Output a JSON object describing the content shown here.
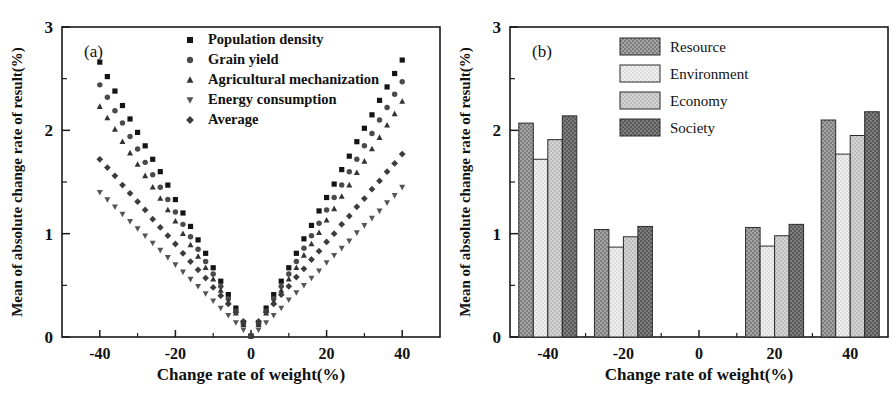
{
  "figure": {
    "width": 896,
    "height": 394,
    "background": "#ffffff",
    "axis_color": "#1a1a1a"
  },
  "panel_a": {
    "label": "(a)",
    "xlabel": "Change rate of weight(%)",
    "ylabel": "Mean of absolute change rate of result(%)",
    "legend": [
      {
        "label": "Population density",
        "marker": "square",
        "color": "#141414"
      },
      {
        "label": "Grain yield",
        "marker": "circle",
        "color": "#4a4a4a"
      },
      {
        "label": "Agricultural mechanization",
        "marker": "triangle-up",
        "color": "#333333"
      },
      {
        "label": "Energy consumption",
        "marker": "triangle-down",
        "color": "#555555"
      },
      {
        "label": "Average",
        "marker": "diamond",
        "color": "#3c3c3c"
      }
    ],
    "chart_data": {
      "type": "scatter",
      "title": "(a)",
      "xlabel": "Change rate of weight(%)",
      "ylabel": "Mean of absolute change rate of result(%)",
      "xlim": [
        -50,
        50
      ],
      "ylim": [
        0,
        3
      ],
      "xticks": [
        -40,
        -20,
        0,
        20,
        40
      ],
      "yticks": [
        0,
        1,
        2,
        3
      ],
      "xminor": [
        -30,
        -10,
        10,
        30
      ],
      "yminor": [
        0.5,
        1.5,
        2.5
      ],
      "grid": false,
      "legend_position": "top-center",
      "x": [
        -40,
        -38,
        -36,
        -34,
        -32,
        -30,
        -28,
        -26,
        -24,
        -22,
        -20,
        -18,
        -16,
        -14,
        -12,
        -10,
        -8,
        -6,
        -4,
        -2,
        0,
        2,
        4,
        6,
        8,
        10,
        12,
        14,
        16,
        18,
        20,
        22,
        24,
        26,
        28,
        30,
        32,
        34,
        36,
        38,
        40
      ],
      "series": [
        {
          "name": "Population density",
          "marker": "square",
          "color": "#141414",
          "values": [
            2.66,
            2.52,
            2.38,
            2.24,
            2.11,
            1.98,
            1.85,
            1.72,
            1.6,
            1.47,
            1.33,
            1.2,
            1.07,
            0.94,
            0.81,
            0.67,
            0.54,
            0.41,
            0.28,
            0.14,
            0.01,
            0.14,
            0.28,
            0.41,
            0.54,
            0.67,
            0.81,
            0.95,
            1.08,
            1.22,
            1.35,
            1.48,
            1.62,
            1.75,
            1.89,
            2.02,
            2.15,
            2.29,
            2.42,
            2.55,
            2.68
          ],
          "sizes": 5
        },
        {
          "name": "Grain yield",
          "marker": "circle",
          "color": "#4a4a4a",
          "values": [
            2.44,
            2.32,
            2.19,
            2.07,
            1.94,
            1.82,
            1.69,
            1.57,
            1.45,
            1.33,
            1.21,
            1.09,
            0.97,
            0.85,
            0.73,
            0.61,
            0.49,
            0.37,
            0.25,
            0.13,
            0.01,
            0.13,
            0.25,
            0.37,
            0.49,
            0.61,
            0.73,
            0.86,
            0.98,
            1.1,
            1.23,
            1.35,
            1.47,
            1.6,
            1.72,
            1.85,
            1.97,
            2.1,
            2.22,
            2.35,
            2.47
          ],
          "sizes": 5
        },
        {
          "name": "Agricultural mechanization",
          "marker": "triangle-up",
          "color": "#333333",
          "values": [
            2.23,
            2.12,
            2.01,
            1.89,
            1.78,
            1.67,
            1.56,
            1.45,
            1.34,
            1.23,
            1.12,
            1.0,
            0.89,
            0.78,
            0.67,
            0.56,
            0.45,
            0.34,
            0.23,
            0.12,
            0.01,
            0.12,
            0.23,
            0.34,
            0.45,
            0.56,
            0.67,
            0.79,
            0.9,
            1.01,
            1.13,
            1.24,
            1.36,
            1.47,
            1.59,
            1.7,
            1.82,
            1.93,
            2.05,
            2.16,
            2.28
          ],
          "sizes": 5
        },
        {
          "name": "Energy consumption",
          "marker": "triangle-down",
          "color": "#555555",
          "values": [
            1.4,
            1.33,
            1.26,
            1.19,
            1.12,
            1.05,
            0.98,
            0.91,
            0.84,
            0.77,
            0.7,
            0.63,
            0.56,
            0.49,
            0.42,
            0.35,
            0.28,
            0.21,
            0.14,
            0.07,
            0.01,
            0.07,
            0.14,
            0.21,
            0.28,
            0.36,
            0.43,
            0.5,
            0.57,
            0.64,
            0.72,
            0.79,
            0.86,
            0.93,
            1.01,
            1.08,
            1.15,
            1.22,
            1.3,
            1.37,
            1.45
          ],
          "sizes": 5
        },
        {
          "name": "Average",
          "marker": "diamond",
          "color": "#3c3c3c",
          "values": [
            1.72,
            1.64,
            1.56,
            1.47,
            1.39,
            1.31,
            1.23,
            1.14,
            1.06,
            0.98,
            0.9,
            0.81,
            0.73,
            0.65,
            0.57,
            0.48,
            0.4,
            0.32,
            0.24,
            0.15,
            0.01,
            0.15,
            0.24,
            0.32,
            0.41,
            0.49,
            0.58,
            0.66,
            0.75,
            0.83,
            0.92,
            1.0,
            1.09,
            1.17,
            1.26,
            1.34,
            1.43,
            1.51,
            1.6,
            1.68,
            1.77
          ],
          "sizes": 5
        }
      ]
    }
  },
  "panel_b": {
    "label": "(b)",
    "xlabel": "Change rate of weight(%)",
    "ylabel": "Mean of absolute change rate of result(%)",
    "legend": [
      {
        "label": "Resource",
        "color": "#8e8e8e"
      },
      {
        "label": "Environment",
        "color": "#e6e6e6"
      },
      {
        "label": "Economy",
        "color": "#c4c4c4"
      },
      {
        "label": "Society",
        "color": "#6b6b6b"
      }
    ],
    "chart_data": {
      "type": "bar",
      "title": "(b)",
      "xlabel": "Change rate of weight(%)",
      "ylabel": "Mean of absolute change rate of result(%)",
      "categories": [
        "-40",
        "-20",
        "20",
        "40"
      ],
      "category_values": [
        -40,
        -20,
        20,
        40
      ],
      "xlim": [
        -50,
        50
      ],
      "ylim": [
        0,
        3
      ],
      "xticks": [
        -40,
        -20,
        0,
        20,
        40
      ],
      "yticks": [
        0,
        1,
        2,
        3
      ],
      "yminor": [
        0.5,
        1.5,
        2.5
      ],
      "grid": false,
      "legend_position": "top-center",
      "series": [
        {
          "name": "Resource",
          "color": "#8e8e8e",
          "values": [
            2.07,
            1.04,
            1.06,
            2.1
          ]
        },
        {
          "name": "Environment",
          "color": "#e6e6e6",
          "values": [
            1.72,
            0.87,
            0.88,
            1.77
          ]
        },
        {
          "name": "Economy",
          "color": "#c4c4c4",
          "values": [
            1.91,
            0.97,
            0.98,
            1.95
          ]
        },
        {
          "name": "Society",
          "color": "#6b6b6b",
          "values": [
            2.14,
            1.07,
            1.09,
            2.18
          ]
        }
      ]
    }
  }
}
